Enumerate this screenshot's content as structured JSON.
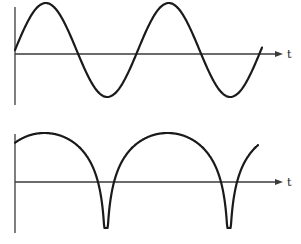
{
  "figure": {
    "colors": {
      "curve": "#1a1a1a",
      "axis": "#3a3a3a",
      "background": "#ffffff"
    }
  },
  "chart_data": [
    {
      "type": "line",
      "title": "",
      "xlabel": "t",
      "ylabel": "",
      "grid": false,
      "waveform": "sine",
      "pixel_layout": {
        "y_axis_x": 15,
        "y_axis_top": 7,
        "y_axis_bottom": 105,
        "baseline_y": 54,
        "x_axis_end": 283,
        "amplitude_px": 47,
        "period_px": 123,
        "phase_start_x": 15,
        "curve_start_x": 15,
        "curve_end_x": 262
      },
      "features": {
        "peaks_x": [
          44,
          168
        ],
        "troughs_x": [
          105,
          230
        ]
      }
    },
    {
      "type": "line",
      "title": "",
      "xlabel": "t",
      "ylabel": "",
      "grid": false,
      "waveform": "log-abs-sine (cusps pointing down)",
      "pixel_layout": {
        "y_axis_x": 15,
        "y_axis_top": 134,
        "y_axis_bottom": 233,
        "baseline_y": 182,
        "x_axis_end": 283,
        "peak_y": 133,
        "log_scale_px": 30.8,
        "cusp_depth_y": 228,
        "period_px": 123,
        "cusp_x": 106,
        "curve_start_x": 15,
        "curve_end_x": 258
      },
      "features": {
        "cusps_x": [
          106,
          229
        ],
        "peaks_x": [
          44,
          168
        ]
      }
    }
  ],
  "labels": {
    "top_axis_label": "t",
    "bottom_axis_label": "t"
  }
}
